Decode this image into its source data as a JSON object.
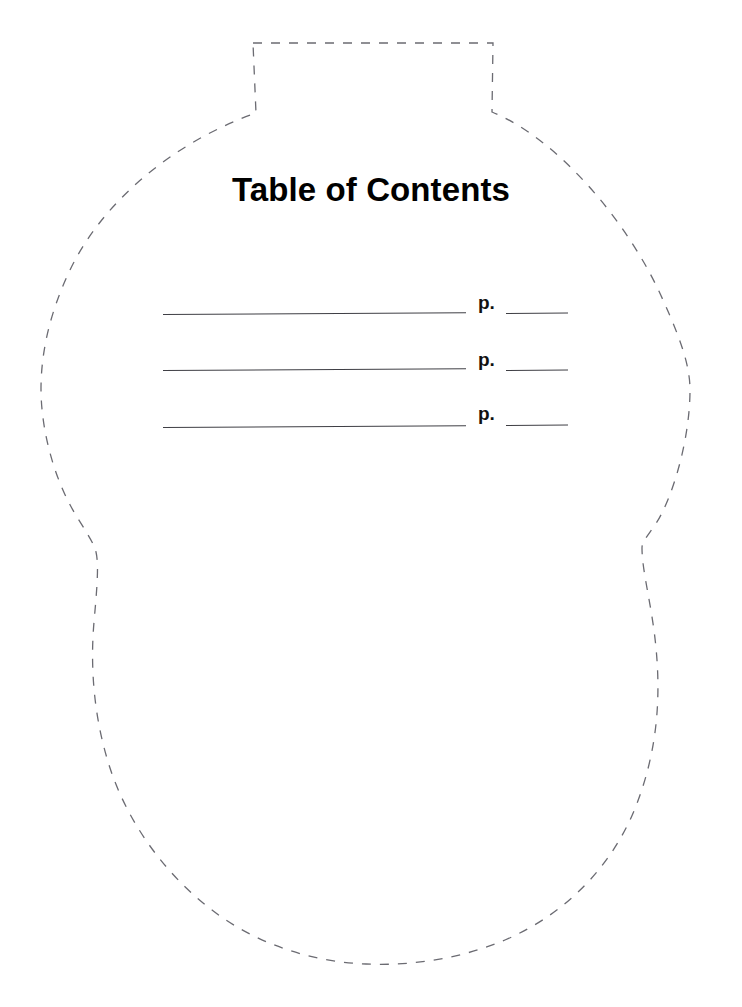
{
  "page": {
    "background_color": "#ffffff",
    "width": 742,
    "height": 1007
  },
  "worksheet": {
    "title": "Table of Contents",
    "shape": {
      "name": "vase-outline",
      "style": "dashed",
      "stroke_color": "#6b6b72",
      "fill": "none"
    },
    "entries": [
      {
        "title_value": "",
        "page_label": "p.",
        "page_value": ""
      },
      {
        "title_value": "",
        "page_label": "p.",
        "page_value": ""
      },
      {
        "title_value": "",
        "page_label": "p.",
        "page_value": ""
      }
    ]
  }
}
